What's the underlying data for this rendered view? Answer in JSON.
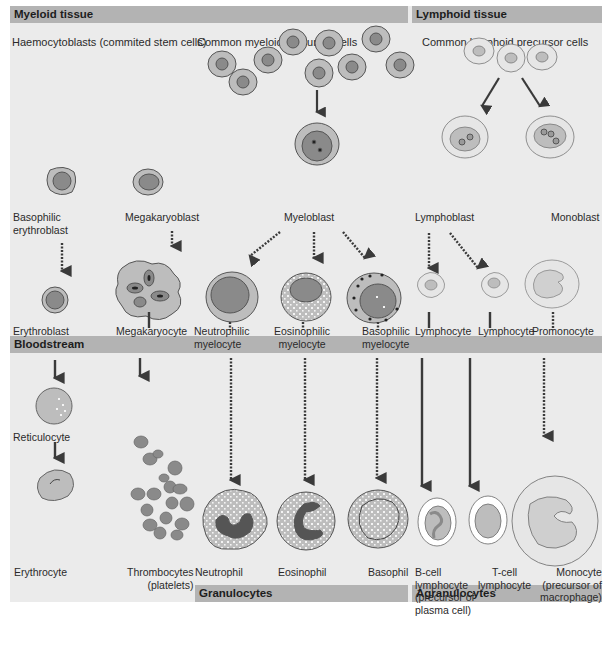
{
  "colors": {
    "panel_bg": "#ebebeb",
    "header_bar": "#b3b3b3",
    "cell_cytoplasm": "#bdbdbd",
    "cell_nucleus": "#8a8a8a",
    "arrow": "#3a3a3a"
  },
  "sections": {
    "myeloid_tissue": "Myeloid tissue",
    "lymphoid_tissue": "Lymphoid tissue",
    "bloodstream": "Bloodstream",
    "granulocytes": "Granulocytes",
    "agranulocytes": "Agranulocytes"
  },
  "subheadings": {
    "haemocytoblasts": "Haemocytoblasts (commited stem cells)",
    "common_myeloid": "Common myeloid precursor cells",
    "common_lymphoid": "Common lymphoid precursor cells"
  },
  "blasts": {
    "basophilic_erythroblast": [
      "Basophilic",
      "erythroblast"
    ],
    "megakaryoblast": "Megakaryoblast",
    "myeloblast": "Myeloblast",
    "lymphoblast": "Lymphoblast",
    "monoblast": "Monoblast"
  },
  "intermediate": {
    "erythroblast": "Erythroblast",
    "megakaryocyte": "Megakaryocyte",
    "neutrophilic_myelocyte": [
      "Neutrophilic",
      "myelocyte"
    ],
    "eosinophilic_myelocyte": [
      "Eosinophilic",
      "myelocyte"
    ],
    "basophilic_myelocyte": [
      "Basophilic",
      "myelocyte"
    ],
    "lymphocyte_1": "Lymphocyte",
    "lymphocyte_2": "Lymphocyte",
    "promonocyte": "Promonocyte"
  },
  "mature": {
    "reticulocyte": "Reticulocyte",
    "erythrocyte": "Erythrocyte",
    "thrombocytes": [
      "Thrombocytes",
      "(platelets)"
    ],
    "neutrophil": "Neutrophil",
    "eosinophil": "Eosinophil",
    "basophil": "Basophil",
    "b_cell": [
      "B-cell",
      "lymphocyte",
      "(precursor of",
      "plasma cell)"
    ],
    "t_cell": [
      "T-cell",
      "lymphocyte"
    ],
    "monocyte": [
      "Monocyte",
      "(precursor of",
      "macrophage)"
    ]
  }
}
